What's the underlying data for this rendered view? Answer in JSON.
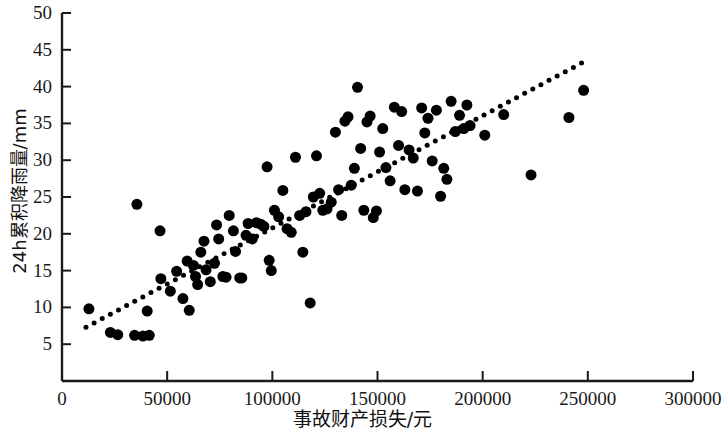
{
  "chart_data": {
    "type": "scatter",
    "title": "",
    "xlabel": "事故财产损失/元",
    "ylabel": "24h累积降雨量/mm",
    "xlim": [
      0,
      300000
    ],
    "ylim": [
      0,
      50
    ],
    "grid": false,
    "legend": null,
    "xticks": [
      0,
      50000,
      100000,
      150000,
      200000,
      250000,
      300000
    ],
    "xtick_labels": [
      "0",
      "50000",
      "100000",
      "150000",
      "200000",
      "250000",
      "300000"
    ],
    "yticks": [
      5,
      10,
      15,
      20,
      25,
      30,
      35,
      40,
      45,
      50
    ],
    "ytick_labels": [
      "5",
      "10",
      "15",
      "20",
      "25",
      "30",
      "35",
      "40",
      "45",
      "50"
    ],
    "marker": {
      "shape": "circle",
      "color": "#000000",
      "size_px": 11
    },
    "trendline": {
      "style": "dotted",
      "color": "#000000",
      "x_start": 11400,
      "y_start": 7.3,
      "x_end": 247000,
      "y_end": 43.2
    },
    "points": [
      [
        12800,
        9.8
      ],
      [
        23000,
        6.6
      ],
      [
        26500,
        6.3
      ],
      [
        35600,
        24.0
      ],
      [
        34500,
        6.2
      ],
      [
        38500,
        6.1
      ],
      [
        40500,
        9.5
      ],
      [
        41500,
        6.2
      ],
      [
        46600,
        20.4
      ],
      [
        47000,
        13.9
      ],
      [
        51500,
        12.2
      ],
      [
        54500,
        14.9
      ],
      [
        57500,
        11.2
      ],
      [
        59500,
        16.3
      ],
      [
        60500,
        9.6
      ],
      [
        62500,
        15.7
      ],
      [
        63500,
        14.2
      ],
      [
        64500,
        13.1
      ],
      [
        66000,
        17.5
      ],
      [
        67500,
        19.0
      ],
      [
        68500,
        15.1
      ],
      [
        70500,
        13.5
      ],
      [
        72500,
        16.0
      ],
      [
        73500,
        21.2
      ],
      [
        74500,
        19.3
      ],
      [
        76500,
        14.2
      ],
      [
        78000,
        14.1
      ],
      [
        79500,
        22.5
      ],
      [
        81500,
        20.4
      ],
      [
        82500,
        17.6
      ],
      [
        84500,
        14.0
      ],
      [
        85500,
        14.0
      ],
      [
        87500,
        19.8
      ],
      [
        88500,
        21.4
      ],
      [
        90500,
        19.3
      ],
      [
        92500,
        21.5
      ],
      [
        94500,
        21.3
      ],
      [
        96000,
        21.0
      ],
      [
        97500,
        29.1
      ],
      [
        98500,
        16.4
      ],
      [
        99500,
        15.0
      ],
      [
        101000,
        23.2
      ],
      [
        103000,
        22.3
      ],
      [
        105000,
        25.9
      ],
      [
        107000,
        20.7
      ],
      [
        109000,
        20.2
      ],
      [
        111000,
        30.4
      ],
      [
        113000,
        22.5
      ],
      [
        114500,
        17.5
      ],
      [
        116000,
        23.0
      ],
      [
        118000,
        10.6
      ],
      [
        119500,
        25.0
      ],
      [
        121000,
        30.6
      ],
      [
        122500,
        25.5
      ],
      [
        124000,
        23.2
      ],
      [
        126000,
        23.4
      ],
      [
        128000,
        24.3
      ],
      [
        130000,
        33.8
      ],
      [
        131500,
        26.0
      ],
      [
        133000,
        22.5
      ],
      [
        134500,
        35.3
      ],
      [
        136000,
        35.9
      ],
      [
        137500,
        26.6
      ],
      [
        139000,
        28.9
      ],
      [
        140500,
        39.9
      ],
      [
        142000,
        31.6
      ],
      [
        143500,
        23.2
      ],
      [
        145000,
        35.2
      ],
      [
        146500,
        36.0
      ],
      [
        148000,
        22.2
      ],
      [
        149500,
        23.1
      ],
      [
        151000,
        31.1
      ],
      [
        152500,
        34.3
      ],
      [
        154000,
        29.0
      ],
      [
        156000,
        27.2
      ],
      [
        158000,
        37.2
      ],
      [
        160000,
        32.0
      ],
      [
        161500,
        36.6
      ],
      [
        163000,
        26.0
      ],
      [
        165000,
        31.4
      ],
      [
        167000,
        30.3
      ],
      [
        169000,
        25.8
      ],
      [
        171000,
        37.1
      ],
      [
        172500,
        33.7
      ],
      [
        174000,
        35.7
      ],
      [
        176000,
        29.9
      ],
      [
        178000,
        36.8
      ],
      [
        180000,
        25.1
      ],
      [
        181500,
        28.9
      ],
      [
        183000,
        27.4
      ],
      [
        185000,
        38.0
      ],
      [
        187000,
        33.9
      ],
      [
        189000,
        36.1
      ],
      [
        191000,
        34.3
      ],
      [
        192500,
        37.5
      ],
      [
        194000,
        34.7
      ],
      [
        210000,
        36.2
      ],
      [
        201000,
        33.4
      ],
      [
        223000,
        28.0
      ],
      [
        241000,
        35.8
      ],
      [
        248000,
        39.5
      ]
    ]
  }
}
